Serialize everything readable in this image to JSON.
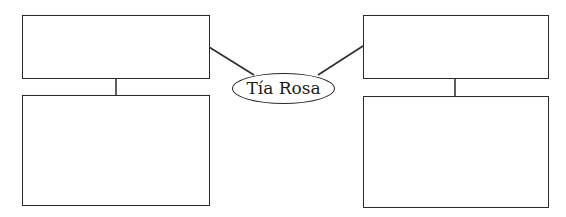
{
  "diagram": {
    "type": "concept-map",
    "center_node": {
      "label": "Tía Rosa",
      "shape": "ellipse"
    },
    "branches": [
      {
        "side": "left",
        "top_box": {
          "text": ""
        },
        "bottom_box": {
          "text": ""
        }
      },
      {
        "side": "right",
        "top_box": {
          "text": ""
        },
        "bottom_box": {
          "text": ""
        }
      }
    ],
    "colors": {
      "stroke": "#2a2a2a",
      "background": "#ffffff",
      "text": "#1a1a1a"
    }
  }
}
